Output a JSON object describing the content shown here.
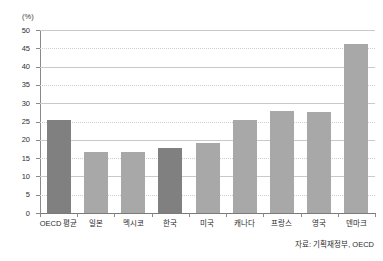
{
  "chart_data": {
    "type": "bar",
    "title": "",
    "xlabel": "",
    "ylabel": "(%)",
    "ylim": [
      0,
      50
    ],
    "yticks": [
      0,
      5,
      10,
      15,
      20,
      25,
      30,
      35,
      40,
      45,
      50
    ],
    "ytick_labels": [
      "0",
      "5",
      "10",
      "15",
      "20",
      "25",
      "30",
      "35",
      "40",
      "45",
      "50"
    ],
    "grid": true,
    "legend": "none",
    "categories": [
      "OECD 평균",
      "일본",
      "멕시코",
      "한국",
      "미국",
      "캐나다",
      "프랑스",
      "영국",
      "덴마크"
    ],
    "values": [
      25.3,
      16.8,
      16.8,
      17.8,
      19.0,
      25.5,
      27.8,
      27.7,
      46.2
    ],
    "highlighted": [
      "OECD 평균",
      "한국"
    ],
    "series": [
      {
        "name": "조세부담률",
        "values": [
          25.3,
          16.8,
          16.8,
          17.8,
          19.0,
          25.5,
          27.8,
          27.7,
          46.2
        ]
      }
    ],
    "annotations": {
      "source": "자료: 기획재정부, OECD"
    }
  },
  "axis": {
    "unit_label": "(%)"
  },
  "colors": {
    "bar_default": "#a8a8a8",
    "bar_highlight": "#808080",
    "gridline": "#c9c9c9",
    "axis": "#8a8a8a",
    "text": "#2b2b2b",
    "background": "#ffffff"
  },
  "footer": {
    "source_text": "자료: 기획재정부, OECD"
  },
  "header": {
    "clipped_title": ""
  }
}
